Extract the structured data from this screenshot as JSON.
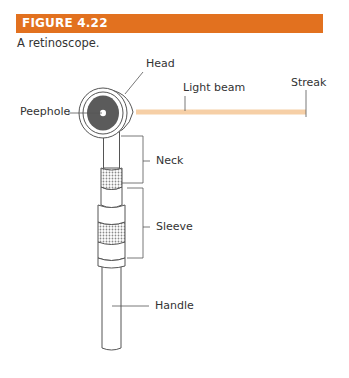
{
  "figure": {
    "number_label": "FIGURE 4.22",
    "caption": "A retinoscope.",
    "accent_color": "#e2711f",
    "beam_color": "#f6cfa6"
  },
  "labels": {
    "head": "Head",
    "light_beam": "Light beam",
    "streak": "Streak",
    "peephole": "Peephole",
    "neck": "Neck",
    "sleeve": "Sleeve",
    "handle": "Handle"
  }
}
